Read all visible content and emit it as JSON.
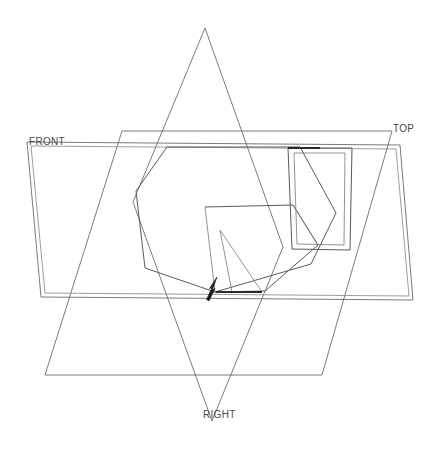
{
  "drawing": {
    "title": "3D Reference Plane Wireframe",
    "background_color": "#ffffff",
    "line_color": "#6b6b6b",
    "bold_line_color": "#2a2a2a",
    "label_color": "#4a4a4a",
    "width": 440,
    "height": 450
  },
  "planes": {
    "front": {
      "label": "FRONT",
      "label_x": 29,
      "label_y": 136,
      "outline": "27,142 400,145 413,300 41,297",
      "outline_inner": "31,146 396,149 409,296 45,293"
    },
    "top": {
      "label": "TOP",
      "label_x": 393,
      "label_y": 123,
      "outline": "122,131 392,131 322,375 45,375"
    },
    "right": {
      "label": "RIGHT",
      "label_x": 203,
      "label_y": 409,
      "outline": "205,28 283,247 212,421 133,202"
    }
  },
  "part": {
    "name": "angular-bracket",
    "body_outline": "136,191 167,147 300,147 336,213 311,264 215,292 145,268",
    "notch_outline": "205,207 293,205 318,245 265,291 213,292",
    "flange_outer": "288,148 352,148 350,250 292,249",
    "flange_inner": "294,153 345,153 344,245 297,244",
    "bold_segments": [
      "288,148 320,148",
      "216,292 262,292"
    ],
    "inner_lines": [
      "205,207 215,292",
      "293,205 318,245",
      "262,292 220,230",
      "220,230 232,292"
    ]
  },
  "arrow": {
    "name": "direction-arrow",
    "color": "#1a1a1a",
    "tip_x": 217,
    "tip_y": 278,
    "tail_x": 208,
    "tail_y": 300
  }
}
